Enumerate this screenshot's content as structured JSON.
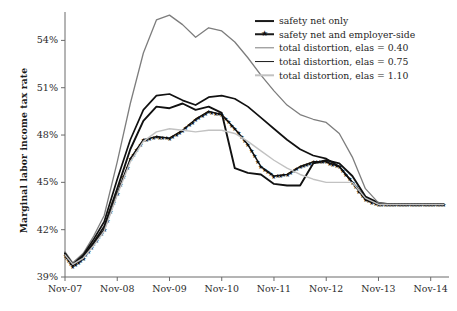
{
  "chart_data": {
    "type": "line",
    "title": "",
    "xlabel": "",
    "ylabel": "Marginal labor income tax rate",
    "xtick_labels": [
      "Nov-07",
      "Nov-08",
      "Nov-09",
      "Nov-10",
      "Nov-11",
      "Nov-12",
      "Nov-13",
      "Nov-14"
    ],
    "ytick_labels": [
      "39%",
      "42%",
      "45%",
      "48%",
      "51%",
      "54%"
    ],
    "ytick_values": [
      39,
      42,
      45,
      48,
      51,
      54
    ],
    "ylim": [
      39,
      55.8
    ],
    "xlim": [
      2007.85,
      2015.2
    ],
    "grid": false,
    "legend_position": "top-right",
    "x": [
      2007.85,
      2008.0,
      2008.2,
      2008.4,
      2008.6,
      2008.85,
      2009.1,
      2009.35,
      2009.6,
      2009.85,
      2010.1,
      2010.35,
      2010.6,
      2010.85,
      2011.1,
      2011.35,
      2011.6,
      2011.85,
      2012.1,
      2012.35,
      2012.6,
      2012.85,
      2013.1,
      2013.35,
      2013.6,
      2013.85,
      2014.1,
      2014.35,
      2014.6,
      2014.85,
      2015.1
    ],
    "series": [
      {
        "name": "safety net only",
        "color": "#111111",
        "width": 1.9,
        "marker": "none",
        "values": [
          40.5,
          39.8,
          40.3,
          41.2,
          42.2,
          44.6,
          47.1,
          48.9,
          49.8,
          49.7,
          50.0,
          49.6,
          49.8,
          49.4,
          45.9,
          45.6,
          45.5,
          44.9,
          44.8,
          44.8,
          46.2,
          46.4,
          46.2,
          45.4,
          44.1,
          43.7,
          43.6,
          43.6,
          43.6,
          43.6,
          43.6
        ]
      },
      {
        "name": "safety net and employer-side",
        "color": "#111111",
        "width": 1.5,
        "marker": "star",
        "values": [
          40.4,
          39.7,
          40.2,
          41.1,
          42.0,
          44.3,
          46.5,
          47.7,
          47.9,
          47.8,
          48.3,
          49.0,
          49.5,
          49.3,
          48.4,
          47.4,
          46.0,
          45.4,
          45.5,
          46.0,
          46.3,
          46.3,
          46.0,
          45.0,
          43.9,
          43.6,
          43.6,
          43.6,
          43.6,
          43.6,
          43.6
        ]
      },
      {
        "name": "total distortion, elas = 0.40",
        "color": "#7d7d7d",
        "width": 1.3,
        "marker": "none",
        "values": [
          40.6,
          39.9,
          40.5,
          41.6,
          42.9,
          46.3,
          50.0,
          53.2,
          55.3,
          55.6,
          55.0,
          54.2,
          54.8,
          54.6,
          53.9,
          52.9,
          51.8,
          50.8,
          49.9,
          49.3,
          49.0,
          48.8,
          48.1,
          46.6,
          44.6,
          43.7,
          43.6,
          43.6,
          43.6,
          43.6,
          43.6
        ]
      },
      {
        "name": "total distortion, elas = 0.75",
        "color": "#111111",
        "width": 1.7,
        "marker": "none",
        "values": [
          40.5,
          39.8,
          40.4,
          41.4,
          42.5,
          45.2,
          47.7,
          49.6,
          50.5,
          50.6,
          50.2,
          49.9,
          50.4,
          50.5,
          50.3,
          49.8,
          49.1,
          48.4,
          47.7,
          47.1,
          46.7,
          46.5,
          46.0,
          45.0,
          44.0,
          43.6,
          43.6,
          43.6,
          43.6,
          43.6,
          43.6
        ]
      },
      {
        "name": "total distortion, elas = 1.10",
        "color": "#c2c2c2",
        "width": 1.4,
        "marker": "none",
        "values": [
          40.4,
          39.8,
          40.2,
          41.0,
          41.9,
          44.2,
          46.3,
          47.6,
          48.2,
          48.4,
          48.3,
          48.2,
          48.3,
          48.3,
          48.1,
          47.6,
          47.0,
          46.4,
          45.9,
          45.5,
          45.2,
          45.0,
          45.0,
          45.0,
          44.0,
          43.6,
          43.6,
          43.6,
          43.6,
          43.6,
          43.6
        ]
      }
    ]
  },
  "legend": {
    "items": [
      {
        "label": "safety net only",
        "style": "thick"
      },
      {
        "label": "safety net and employer-side",
        "style": "star"
      },
      {
        "label": "total distortion, elas = 0.40",
        "style": "mid"
      },
      {
        "label": "total distortion, elas = 0.75",
        "style": "thick"
      },
      {
        "label": "total distortion, elas = 1.10",
        "style": "light"
      }
    ]
  },
  "colors": {
    "axis": "#6b6b6b",
    "text": "#1f1f1f",
    "background": "#ffffff"
  }
}
